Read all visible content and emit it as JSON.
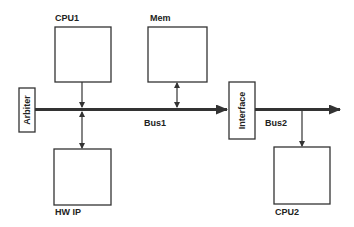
{
  "diagram": {
    "title": "",
    "colors": {
      "line": "#333333",
      "text": "#222222",
      "background": "#ffffff"
    },
    "blocks": [
      {
        "id": "cpu1",
        "label": "CPU1"
      },
      {
        "id": "mem",
        "label": "Mem"
      },
      {
        "id": "hwip",
        "label": "HW IP"
      },
      {
        "id": "cpu2",
        "label": "CPU2"
      },
      {
        "id": "arbiter",
        "label": "Arbiter"
      },
      {
        "id": "interface",
        "label": "Interface"
      }
    ],
    "buses": [
      {
        "id": "bus1",
        "label": "Bus1"
      },
      {
        "id": "bus2",
        "label": "Bus2"
      }
    ],
    "connections": [
      {
        "from": "cpu1",
        "to": "bus1",
        "type": "arrow"
      },
      {
        "from": "mem",
        "to": "bus1",
        "type": "bidirectional"
      },
      {
        "from": "bus1",
        "to": "hwip",
        "type": "bidirectional"
      },
      {
        "from": "arbiter",
        "to": "interface",
        "type": "bus",
        "label": "Bus1"
      },
      {
        "from": "interface",
        "to": "out",
        "type": "bus",
        "label": "Bus2"
      },
      {
        "from": "bus2",
        "to": "cpu2",
        "type": "arrow"
      }
    ]
  }
}
